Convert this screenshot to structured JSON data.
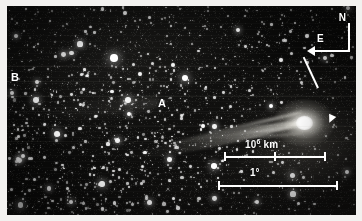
{
  "figure": {
    "type": "astronomical-photograph",
    "background_color": "#0a0a0a",
    "annotation_color": "#ffffff",
    "margin_color": "#f2f1ef"
  },
  "annotations": {
    "feature_a": {
      "label": "A",
      "name": "tail-feature-a",
      "x": 151,
      "y": 92
    },
    "feature_b": {
      "label": "B",
      "name": "tail-feature-b",
      "x": 4,
      "y": 66
    }
  },
  "compass": {
    "north_label": "N",
    "east_label": "E",
    "north_direction": "up",
    "east_direction": "left"
  },
  "nucleus_marker": {
    "description": "arrow indicating comet nucleus",
    "points_to": "comet-coma"
  },
  "scale_bars": [
    {
      "name": "linear-scale",
      "label_text": "10",
      "label_exponent": "6",
      "label_unit": "km",
      "length_px": 102,
      "ticks": [
        "left",
        "mid",
        "right"
      ]
    },
    {
      "name": "angular-scale",
      "label_text": "1°",
      "length_px": 120,
      "ticks": [
        "left",
        "right"
      ]
    }
  ],
  "comet": {
    "coma_center_x": 297,
    "coma_center_y": 117,
    "coma_width": 62,
    "coma_height": 48,
    "tail_direction_degrees": -11.5,
    "tail_length_px": 182
  },
  "starfield": {
    "seed": 20240617,
    "count": 1150,
    "dense_count": 260,
    "bright_stars": [
      {
        "x": 107,
        "y": 52,
        "r": 3.8
      },
      {
        "x": 73,
        "y": 38,
        "r": 2.6
      },
      {
        "x": 29,
        "y": 94,
        "r": 2.9
      },
      {
        "x": 50,
        "y": 128,
        "r": 3.1
      },
      {
        "x": 178,
        "y": 72,
        "r": 3.4
      },
      {
        "x": 231,
        "y": 24,
        "r": 2.4
      },
      {
        "x": 264,
        "y": 100,
        "r": 2.2
      },
      {
        "x": 318,
        "y": 52,
        "r": 2.3
      },
      {
        "x": 207,
        "y": 160,
        "r": 2.8
      },
      {
        "x": 95,
        "y": 178,
        "r": 2.7
      },
      {
        "x": 142,
        "y": 196,
        "r": 2.5
      },
      {
        "x": 286,
        "y": 188,
        "r": 2.6
      },
      {
        "x": 16,
        "y": 150,
        "r": 2.4
      },
      {
        "x": 250,
        "y": 196,
        "r": 2.3
      },
      {
        "x": 340,
        "y": 166,
        "r": 2.2
      },
      {
        "x": 122,
        "y": 108,
        "r": 2.1
      },
      {
        "x": 64,
        "y": 196,
        "r": 2.4
      },
      {
        "x": 196,
        "y": 120,
        "r": 2.0
      },
      {
        "x": 9,
        "y": 30,
        "r": 2.1
      },
      {
        "x": 300,
        "y": 30,
        "r": 1.9
      }
    ],
    "scan_bands_y": [
      60,
      75,
      90,
      105,
      120,
      135
    ]
  }
}
